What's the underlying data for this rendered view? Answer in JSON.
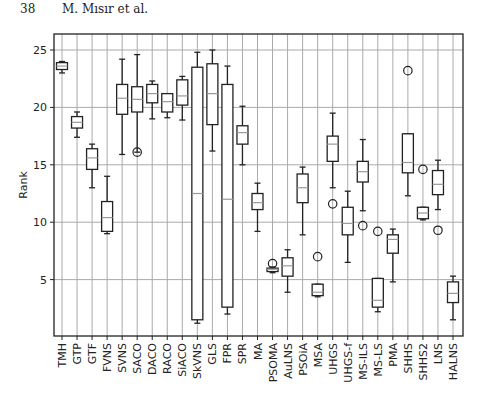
{
  "page": {
    "number": "38",
    "authors": "M. Mısır et al."
  },
  "chart_data": {
    "type": "box",
    "title": "",
    "xlabel": "",
    "ylabel": "Rank",
    "ylim": [
      0,
      26.2
    ],
    "yticks": [
      5,
      10,
      15,
      20,
      25
    ],
    "grid": true,
    "categories": [
      "TMH",
      "GTP",
      "GTF",
      "FVNS",
      "SVNS",
      "SACO",
      "DACO",
      "RACO",
      "SiACO",
      "SkVNS",
      "GLS",
      "FPR",
      "SPR",
      "MA",
      "PSOMA",
      "AuLNS",
      "PSOiA",
      "MSA",
      "UHGS",
      "UHGS-f",
      "MS-ILS",
      "MS-LS",
      "PMA",
      "SHHS",
      "SHHS2",
      "LNS",
      "HALNS"
    ],
    "boxes": [
      {
        "wlo": 23.0,
        "q1": 23.3,
        "med": 23.6,
        "q3": 23.9,
        "whi": 24.0,
        "out": []
      },
      {
        "wlo": 17.4,
        "q1": 18.2,
        "med": 18.7,
        "q3": 19.2,
        "whi": 19.6,
        "out": []
      },
      {
        "wlo": 13.0,
        "q1": 14.6,
        "med": 15.6,
        "q3": 16.4,
        "whi": 16.8,
        "out": []
      },
      {
        "wlo": 9.0,
        "q1": 9.2,
        "med": 10.4,
        "q3": 11.8,
        "whi": 14.0,
        "out": []
      },
      {
        "wlo": 15.9,
        "q1": 19.4,
        "med": 20.8,
        "q3": 22.0,
        "whi": 24.2,
        "out": []
      },
      {
        "wlo": 16.1,
        "q1": 19.6,
        "med": 20.7,
        "q3": 21.8,
        "whi": 24.6,
        "out": [
          16.1
        ]
      },
      {
        "wlo": 19.0,
        "q1": 20.4,
        "med": 21.2,
        "q3": 22.0,
        "whi": 22.3,
        "out": []
      },
      {
        "wlo": 19.1,
        "q1": 19.6,
        "med": 20.5,
        "q3": 21.2,
        "whi": 21.2,
        "out": []
      },
      {
        "wlo": 18.9,
        "q1": 20.2,
        "med": 21.0,
        "q3": 22.4,
        "whi": 22.7,
        "out": []
      },
      {
        "wlo": 1.2,
        "q1": 1.5,
        "med": 12.5,
        "q3": 23.5,
        "whi": 24.8,
        "out": []
      },
      {
        "wlo": 16.2,
        "q1": 18.5,
        "med": 21.2,
        "q3": 23.8,
        "whi": 25.0,
        "out": []
      },
      {
        "wlo": 2.0,
        "q1": 2.6,
        "med": 12.0,
        "q3": 22.0,
        "whi": 23.6,
        "out": []
      },
      {
        "wlo": 15.0,
        "q1": 16.8,
        "med": 17.8,
        "q3": 18.4,
        "whi": 20.1,
        "out": []
      },
      {
        "wlo": 9.2,
        "q1": 11.1,
        "med": 11.7,
        "q3": 12.5,
        "whi": 13.4,
        "out": []
      },
      {
        "wlo": 5.6,
        "q1": 5.7,
        "med": 5.9,
        "q3": 6.0,
        "whi": 6.1,
        "out": [
          6.4
        ]
      },
      {
        "wlo": 3.9,
        "q1": 5.3,
        "med": 6.2,
        "q3": 6.9,
        "whi": 7.6,
        "out": []
      },
      {
        "wlo": 8.9,
        "q1": 11.7,
        "med": 13.0,
        "q3": 14.2,
        "whi": 14.8,
        "out": []
      },
      {
        "wlo": 3.5,
        "q1": 3.6,
        "med": 3.9,
        "q3": 4.6,
        "whi": 4.6,
        "out": [
          7.0
        ]
      },
      {
        "wlo": 13.0,
        "q1": 15.3,
        "med": 16.8,
        "q3": 17.5,
        "whi": 19.5,
        "out": [
          11.6
        ]
      },
      {
        "wlo": 6.5,
        "q1": 8.9,
        "med": 9.9,
        "q3": 11.3,
        "whi": 12.7,
        "out": []
      },
      {
        "wlo": 11.0,
        "q1": 13.5,
        "med": 14.4,
        "q3": 15.3,
        "whi": 17.2,
        "out": [
          9.7
        ]
      },
      {
        "wlo": 2.2,
        "q1": 2.6,
        "med": 3.2,
        "q3": 5.1,
        "whi": 5.1,
        "out": [
          9.2
        ]
      },
      {
        "wlo": 4.8,
        "q1": 7.3,
        "med": 8.5,
        "q3": 8.9,
        "whi": 9.4,
        "out": []
      },
      {
        "wlo": 12.3,
        "q1": 14.3,
        "med": 15.2,
        "q3": 17.7,
        "whi": 17.7,
        "out": [
          23.2
        ]
      },
      {
        "wlo": 10.2,
        "q1": 10.3,
        "med": 10.8,
        "q3": 11.3,
        "whi": 11.3,
        "out": [
          14.6
        ]
      },
      {
        "wlo": 11.1,
        "q1": 12.4,
        "med": 13.3,
        "q3": 14.5,
        "whi": 15.4,
        "out": [
          9.3
        ]
      },
      {
        "wlo": 1.5,
        "q1": 3.0,
        "med": 3.8,
        "q3": 4.8,
        "whi": 5.3,
        "out": []
      }
    ]
  }
}
